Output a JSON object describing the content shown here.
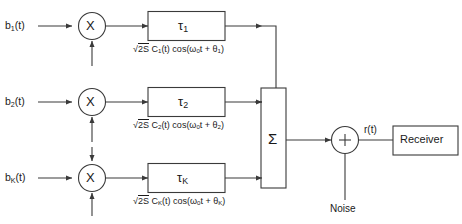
{
  "diagram": {
    "stroke_color": "#3a3a3a",
    "text_color": "#1a1a1a",
    "background": "#ffffff"
  },
  "branches": [
    {
      "input_label": "b",
      "input_sub": "1",
      "input_suffix": "(t)",
      "multiplier_symbol": "X",
      "delay_label": "τ",
      "delay_sub": "1",
      "carrier_prefix": "√",
      "carrier_overline": "2S",
      "carrier_mid": " C",
      "carrier_sub1": "1",
      "carrier_mid2": "(t) cos(ω",
      "carrier_sub2": "0",
      "carrier_mid3": "t + θ",
      "carrier_sub3": "1",
      "carrier_end": ")"
    },
    {
      "input_label": "b",
      "input_sub": "2",
      "input_suffix": "(t)",
      "multiplier_symbol": "X",
      "delay_label": "τ",
      "delay_sub": "2",
      "carrier_prefix": "√",
      "carrier_overline": "2S",
      "carrier_mid": " C",
      "carrier_sub1": "2",
      "carrier_mid2": "(t) cos(ω",
      "carrier_sub2": "0",
      "carrier_mid3": "t + θ",
      "carrier_sub3": "2",
      "carrier_end": ")"
    },
    {
      "input_label": "b",
      "input_sub": "K",
      "input_suffix": "(t)",
      "multiplier_symbol": "X",
      "delay_label": "τ",
      "delay_sub": "K",
      "carrier_prefix": "√",
      "carrier_overline": "2S",
      "carrier_mid": " C",
      "carrier_sub1": "K",
      "carrier_mid2": "(t) cos(ω",
      "carrier_sub2": "0",
      "carrier_mid3": "t + θ",
      "carrier_sub3": "K",
      "carrier_end": ")"
    }
  ],
  "summer": {
    "symbol": "Σ"
  },
  "adder": {
    "symbol": "+",
    "noise_label": "Noise",
    "output_label": "r(t)"
  },
  "receiver": {
    "label": "Receiver"
  }
}
